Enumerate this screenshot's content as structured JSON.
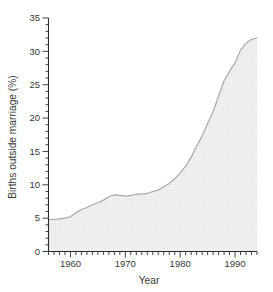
{
  "page": {
    "background": "#ffffff"
  },
  "chart_data": {
    "type": "area",
    "title": "",
    "xlabel": "Year",
    "ylabel": "Births outside marriage (%)",
    "xlim": [
      1956,
      1994
    ],
    "ylim": [
      0,
      35
    ],
    "x_major_ticks": [
      1960,
      1970,
      1980,
      1990
    ],
    "x_minor_tick_step": 1,
    "y_major_ticks": [
      0,
      5,
      10,
      15,
      20,
      25,
      30,
      35
    ],
    "y_minor_tick_step": 1,
    "grid": false,
    "legend": false,
    "series": [
      {
        "name": "births-outside-marriage-percent",
        "x": [
          1956,
          1957,
          1958,
          1959,
          1960,
          1961,
          1962,
          1963,
          1964,
          1965,
          1966,
          1967,
          1968,
          1969,
          1970,
          1971,
          1972,
          1973,
          1974,
          1975,
          1976,
          1977,
          1978,
          1979,
          1980,
          1981,
          1982,
          1983,
          1984,
          1985,
          1986,
          1987,
          1988,
          1989,
          1990,
          1991,
          1992,
          1993,
          1994
        ],
        "y": [
          4.8,
          4.8,
          4.9,
          5.0,
          5.2,
          5.8,
          6.3,
          6.6,
          7.0,
          7.3,
          7.7,
          8.2,
          8.5,
          8.4,
          8.3,
          8.4,
          8.6,
          8.6,
          8.7,
          9.0,
          9.2,
          9.7,
          10.2,
          10.9,
          11.8,
          12.8,
          14.1,
          15.8,
          17.3,
          19.2,
          21.0,
          23.3,
          25.6,
          27.0,
          28.3,
          30.2,
          31.2,
          31.8,
          32.0
        ]
      }
    ],
    "colors": {
      "line": "#a8a8a8",
      "fill": "#efefef",
      "fill_dot": "#e3e3e3",
      "axis": "#2e2e2e",
      "text": "#3a3a3a"
    }
  }
}
